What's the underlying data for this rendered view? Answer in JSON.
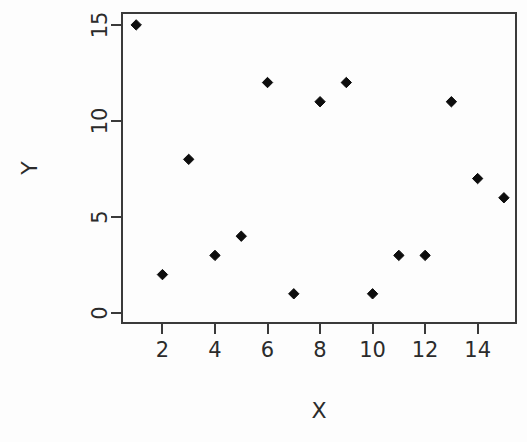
{
  "chart_data": {
    "type": "scatter",
    "title": "",
    "xlabel": "X",
    "ylabel": "Y",
    "x": [
      1,
      2,
      3,
      4,
      5,
      6,
      7,
      8,
      9,
      10,
      11,
      12,
      13,
      14,
      15
    ],
    "y": [
      15,
      2,
      8,
      3,
      4,
      12,
      1,
      11,
      12,
      1,
      3,
      3,
      11,
      7,
      6
    ],
    "points": [
      {
        "x": 1,
        "y": 15
      },
      {
        "x": 2,
        "y": 2
      },
      {
        "x": 3,
        "y": 8
      },
      {
        "x": 4,
        "y": 3
      },
      {
        "x": 5,
        "y": 4
      },
      {
        "x": 6,
        "y": 12
      },
      {
        "x": 7,
        "y": 1
      },
      {
        "x": 8,
        "y": 11
      },
      {
        "x": 9,
        "y": 12
      },
      {
        "x": 10,
        "y": 1
      },
      {
        "x": 11,
        "y": 3
      },
      {
        "x": 12,
        "y": 3
      },
      {
        "x": 13,
        "y": 11
      },
      {
        "x": 14,
        "y": 7
      },
      {
        "x": 15,
        "y": 6
      }
    ],
    "xticks": [
      2,
      4,
      6,
      8,
      10,
      12,
      14
    ],
    "yticks": [
      0,
      5,
      10,
      15
    ],
    "xlim": [
      0.46,
      15.46
    ],
    "ylim": [
      -0.52,
      15.62
    ],
    "grid": false,
    "legend": null,
    "marker": "filled-diamond",
    "marker_color": "#0d0d0d",
    "axis_color": "#3a3a3a",
    "background": "#fdfdfd"
  },
  "axes": {
    "x_title": "X",
    "y_title": "Y"
  }
}
